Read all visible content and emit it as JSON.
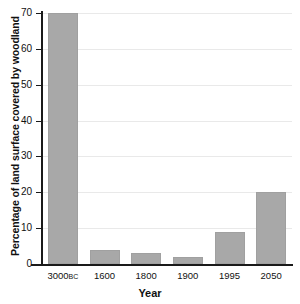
{
  "chart_data": {
    "type": "bar",
    "title": "",
    "xlabel": "Year",
    "ylabel": "Percentage of land surface covered by woodland",
    "categories": [
      "3000BC",
      "1600",
      "1800",
      "1900",
      "1995",
      "2050"
    ],
    "category_labels": [
      {
        "main": "3000",
        "era": "BC"
      },
      {
        "main": "1600",
        "era": ""
      },
      {
        "main": "1800",
        "era": ""
      },
      {
        "main": "1900",
        "era": ""
      },
      {
        "main": "1995",
        "era": ""
      },
      {
        "main": "2050",
        "era": ""
      }
    ],
    "values": [
      70,
      4,
      3,
      2,
      9,
      20
    ],
    "ylim": [
      0,
      70
    ],
    "yticks": [
      0,
      10,
      20,
      30,
      40,
      50,
      60,
      70
    ],
    "ytick_labels": [
      "0",
      "10",
      "20",
      "30",
      "40",
      "50",
      "60",
      "70"
    ],
    "grid": true,
    "legend": false,
    "bar_color": "#a8a8a8",
    "axis_color": "#1a1a1a",
    "grid_color": "#e9e9e9",
    "background": "#ffffff"
  }
}
